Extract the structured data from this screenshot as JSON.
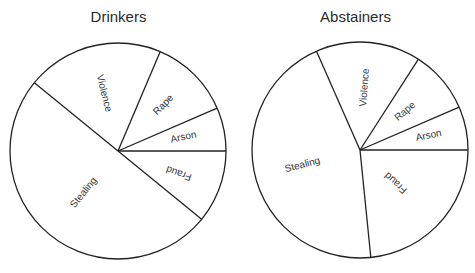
{
  "chart_data": [
    {
      "type": "pie",
      "title": "Drinkers",
      "start_angle_deg": 0,
      "direction": "counterclockwise-from-east",
      "slices": [
        {
          "label": "Arson",
          "value": 6.5
        },
        {
          "label": "Rape",
          "value": 12.1
        },
        {
          "label": "Violence",
          "value": 20.5
        },
        {
          "label": "Stealing",
          "value": 50.0
        },
        {
          "label": "Fraud",
          "value": 10.9
        }
      ],
      "legend": "none (labels inside slices)"
    },
    {
      "type": "pie",
      "title": "Abstainers",
      "start_angle_deg": 0,
      "direction": "counterclockwise-from-east",
      "slices": [
        {
          "label": "Arson",
          "value": 6.5
        },
        {
          "label": "Rape",
          "value": 9.4
        },
        {
          "label": "Violence",
          "value": 15.7
        },
        {
          "label": "Stealing",
          "value": 45.0
        },
        {
          "label": "Fraud",
          "value": 23.4
        }
      ],
      "legend": "none (labels inside slices)"
    }
  ],
  "charts": {
    "left": {
      "title": "Drinkers"
    },
    "right": {
      "title": "Abstainers"
    }
  },
  "style": {
    "stroke": "#222222",
    "fill": "#ffffff",
    "text": "#333333"
  }
}
